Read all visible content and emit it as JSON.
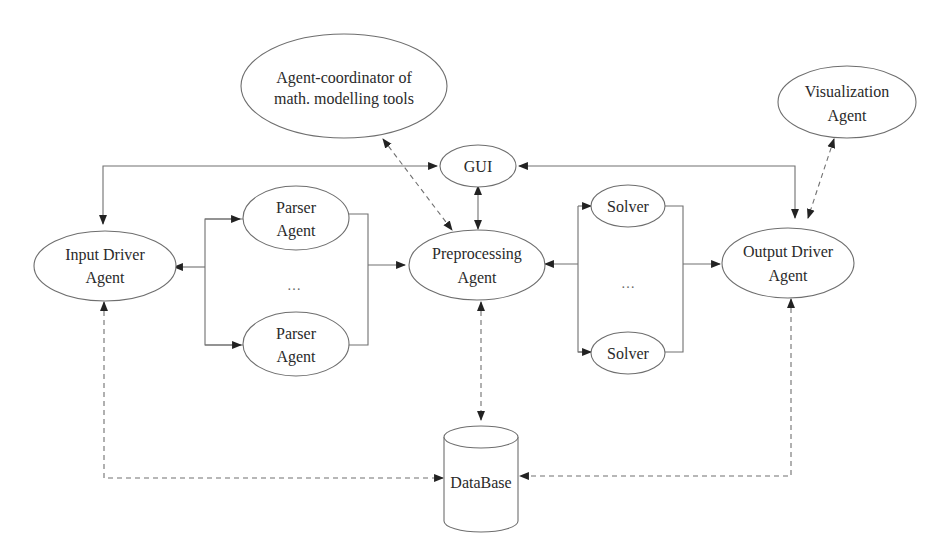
{
  "diagram": {
    "nodes": {
      "coordinator": {
        "lines": [
          "Agent-coordinator of",
          "math. modelling tools"
        ]
      },
      "visualization": {
        "lines": [
          "Visualization",
          "Agent"
        ]
      },
      "gui": {
        "lines": [
          "GUI"
        ]
      },
      "input_driver": {
        "lines": [
          "Input Driver",
          "Agent"
        ]
      },
      "parser_top": {
        "lines": [
          "Parser",
          "Agent"
        ]
      },
      "parser_bottom": {
        "lines": [
          "Parser",
          "Agent"
        ]
      },
      "parser_ellipsis": "…",
      "preprocessing": {
        "lines": [
          "Preprocessing",
          "Agent"
        ]
      },
      "solver_top": {
        "lines": [
          "Solver"
        ]
      },
      "solver_bottom": {
        "lines": [
          "Solver"
        ]
      },
      "solver_ellipsis": "…",
      "output_driver": {
        "lines": [
          "Output Driver",
          "Agent"
        ]
      },
      "database": {
        "lines": [
          "DataBase"
        ]
      }
    },
    "edges": [
      {
        "from": "gui",
        "to": "input_driver",
        "style": "solid",
        "direction": "bidirectional"
      },
      {
        "from": "gui",
        "to": "output_driver",
        "style": "solid",
        "direction": "bidirectional"
      },
      {
        "from": "gui",
        "to": "preprocessing",
        "style": "solid",
        "direction": "bidirectional"
      },
      {
        "from": "coordinator",
        "to": "preprocessing",
        "style": "dashed",
        "direction": "bidirectional"
      },
      {
        "from": "visualization",
        "to": "output_driver",
        "style": "dashed",
        "direction": "bidirectional"
      },
      {
        "from": "parser_group",
        "to": "input_driver",
        "style": "solid",
        "direction": "forward"
      },
      {
        "from": "parser_group",
        "to": "preprocessing",
        "style": "solid",
        "direction": "forward"
      },
      {
        "from": "solver_group",
        "to": "preprocessing",
        "style": "solid",
        "direction": "forward"
      },
      {
        "from": "solver_group",
        "to": "output_driver",
        "style": "solid",
        "direction": "forward"
      },
      {
        "from": "preprocessing",
        "to": "database",
        "style": "dashed",
        "direction": "bidirectional"
      },
      {
        "from": "input_driver",
        "to": "database",
        "style": "dashed",
        "direction": "bidirectional"
      },
      {
        "from": "output_driver",
        "to": "database",
        "style": "dashed",
        "direction": "bidirectional"
      }
    ]
  }
}
